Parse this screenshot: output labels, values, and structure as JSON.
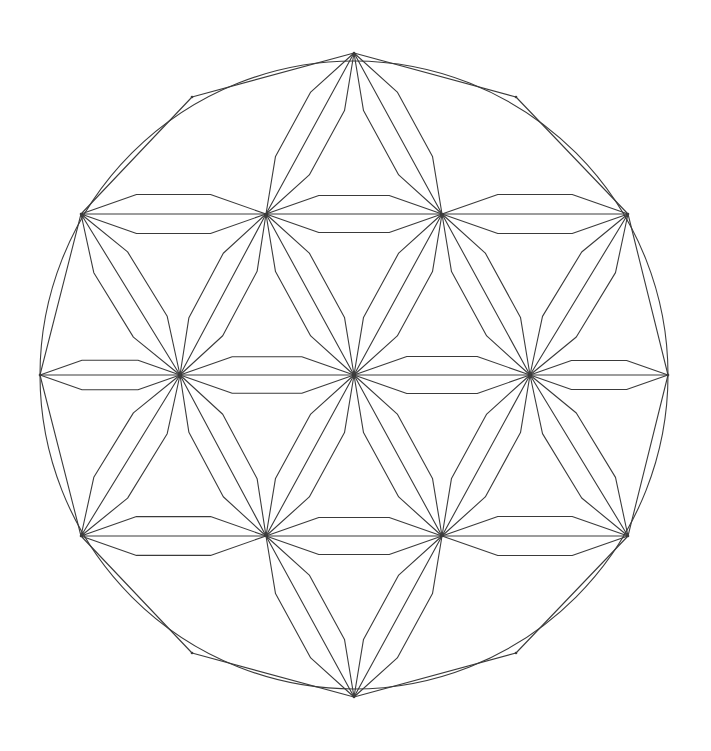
{
  "figure": {
    "title": "Triangular lattice mandala inside a circle",
    "type": "geometric-line-diagram",
    "background_color": "#ffffff",
    "stroke_color": "#3a3a3a",
    "stroke_width": 1.1,
    "canvas": {
      "width": 711,
      "height": 751
    }
  },
  "chart_data": {
    "type": "diagram",
    "title": "Triangular lattice mandala inside a circle",
    "circle": {
      "cx": 354,
      "cy": 375,
      "r": 314
    },
    "lattice": {
      "spacing_x": 176,
      "spacing_y": 161,
      "rows": [
        {
          "row": -2,
          "y": 53,
          "xs": [
            354
          ]
        },
        {
          "row": -1,
          "y": 214,
          "xs": [
            81,
            266,
            442,
            628
          ]
        },
        {
          "row": 0,
          "y": 375,
          "xs": [
            40,
            180,
            354,
            530,
            668
          ]
        },
        {
          "row": 1,
          "y": 536,
          "xs": [
            81,
            266,
            442,
            628
          ]
        },
        {
          "row": 2,
          "y": 697,
          "xs": [
            354
          ]
        }
      ]
    },
    "nodes": [
      {
        "id": "n-top",
        "x": 354,
        "y": 53,
        "rays": 6,
        "on_boundary": true
      },
      {
        "id": "n-upper-far-left",
        "x": 81,
        "y": 214,
        "rays": 8,
        "on_boundary": true
      },
      {
        "id": "n-upper-left",
        "x": 266,
        "y": 214,
        "rays": 12,
        "on_boundary": false
      },
      {
        "id": "n-upper-right",
        "x": 442,
        "y": 214,
        "rays": 12,
        "on_boundary": false
      },
      {
        "id": "n-upper-far-right",
        "x": 628,
        "y": 214,
        "rays": 8,
        "on_boundary": true
      },
      {
        "id": "n-mid-far-left",
        "x": 40,
        "y": 375,
        "rays": 4,
        "on_boundary": true
      },
      {
        "id": "n-mid-left",
        "x": 180,
        "y": 375,
        "rays": 12,
        "on_boundary": false
      },
      {
        "id": "n-center",
        "x": 354,
        "y": 375,
        "rays": 12,
        "on_boundary": false
      },
      {
        "id": "n-mid-right",
        "x": 530,
        "y": 375,
        "rays": 12,
        "on_boundary": false
      },
      {
        "id": "n-mid-far-right",
        "x": 668,
        "y": 375,
        "rays": 4,
        "on_boundary": true
      },
      {
        "id": "n-lower-far-left",
        "x": 81,
        "y": 536,
        "rays": 8,
        "on_boundary": true
      },
      {
        "id": "n-lower-left",
        "x": 266,
        "y": 536,
        "rays": 12,
        "on_boundary": false
      },
      {
        "id": "n-lower-right",
        "x": 442,
        "y": 536,
        "rays": 12,
        "on_boundary": false
      },
      {
        "id": "n-lower-far-right",
        "x": 628,
        "y": 536,
        "rays": 8,
        "on_boundary": true
      },
      {
        "id": "n-bottom",
        "x": 354,
        "y": 697,
        "rays": 6,
        "on_boundary": true
      },
      {
        "id": "n-arc-upper-left",
        "x": 192,
        "y": 97,
        "rays": 5,
        "on_boundary": true
      },
      {
        "id": "n-arc-upper-right",
        "x": 516,
        "y": 97,
        "rays": 5,
        "on_boundary": true
      },
      {
        "id": "n-arc-lower-left",
        "x": 192,
        "y": 653,
        "rays": 5,
        "on_boundary": true
      },
      {
        "id": "n-arc-lower-right",
        "x": 516,
        "y": 653,
        "rays": 5,
        "on_boundary": true
      }
    ],
    "edges": [
      [
        "n-arc-upper-left",
        "n-top"
      ],
      [
        "n-top",
        "n-arc-upper-right"
      ],
      [
        "n-upper-far-left",
        "n-arc-upper-left"
      ],
      [
        "n-arc-upper-right",
        "n-upper-far-right"
      ],
      [
        "n-upper-far-left",
        "n-upper-left"
      ],
      [
        "n-upper-left",
        "n-upper-right"
      ],
      [
        "n-upper-right",
        "n-upper-far-right"
      ],
      [
        "n-mid-far-left",
        "n-mid-left"
      ],
      [
        "n-mid-left",
        "n-center"
      ],
      [
        "n-center",
        "n-mid-right"
      ],
      [
        "n-mid-right",
        "n-mid-far-right"
      ],
      [
        "n-lower-far-left",
        "n-lower-left"
      ],
      [
        "n-lower-left",
        "n-lower-right"
      ],
      [
        "n-lower-right",
        "n-lower-far-right"
      ],
      [
        "n-arc-lower-left",
        "n-bottom"
      ],
      [
        "n-bottom",
        "n-arc-lower-right"
      ],
      [
        "n-lower-far-left",
        "n-arc-lower-left"
      ],
      [
        "n-arc-lower-right",
        "n-lower-far-right"
      ],
      [
        "n-upper-left",
        "n-top"
      ],
      [
        "n-upper-right",
        "n-top"
      ],
      [
        "n-upper-far-left",
        "n-mid-far-left"
      ],
      [
        "n-upper-far-left",
        "n-mid-left"
      ],
      [
        "n-upper-left",
        "n-mid-left"
      ],
      [
        "n-upper-left",
        "n-center"
      ],
      [
        "n-upper-right",
        "n-center"
      ],
      [
        "n-upper-right",
        "n-mid-right"
      ],
      [
        "n-upper-far-right",
        "n-mid-right"
      ],
      [
        "n-upper-far-right",
        "n-mid-far-right"
      ],
      [
        "n-mid-far-left",
        "n-lower-far-left"
      ],
      [
        "n-mid-left",
        "n-lower-far-left"
      ],
      [
        "n-mid-left",
        "n-lower-left"
      ],
      [
        "n-center",
        "n-lower-left"
      ],
      [
        "n-center",
        "n-lower-right"
      ],
      [
        "n-mid-right",
        "n-lower-right"
      ],
      [
        "n-mid-right",
        "n-lower-far-right"
      ],
      [
        "n-mid-far-right",
        "n-lower-far-right"
      ],
      [
        "n-lower-left",
        "n-bottom"
      ],
      [
        "n-lower-right",
        "n-bottom"
      ]
    ],
    "lens_edges": [
      [
        "n-upper-far-left",
        "n-upper-left"
      ],
      [
        "n-upper-left",
        "n-upper-right"
      ],
      [
        "n-upper-right",
        "n-upper-far-right"
      ],
      [
        "n-mid-far-left",
        "n-mid-left"
      ],
      [
        "n-mid-left",
        "n-center"
      ],
      [
        "n-center",
        "n-mid-right"
      ],
      [
        "n-mid-right",
        "n-mid-far-right"
      ],
      [
        "n-lower-far-left",
        "n-lower-left"
      ],
      [
        "n-lower-left",
        "n-lower-right"
      ],
      [
        "n-lower-right",
        "n-lower-far-right"
      ],
      [
        "n-upper-left",
        "n-top"
      ],
      [
        "n-upper-right",
        "n-top"
      ],
      [
        "n-upper-far-left",
        "n-mid-left"
      ],
      [
        "n-upper-left",
        "n-mid-left"
      ],
      [
        "n-upper-left",
        "n-center"
      ],
      [
        "n-upper-right",
        "n-center"
      ],
      [
        "n-upper-right",
        "n-mid-right"
      ],
      [
        "n-upper-far-right",
        "n-mid-right"
      ],
      [
        "n-mid-left",
        "n-lower-far-left"
      ],
      [
        "n-mid-left",
        "n-lower-left"
      ],
      [
        "n-center",
        "n-lower-left"
      ],
      [
        "n-center",
        "n-lower-right"
      ],
      [
        "n-mid-right",
        "n-lower-right"
      ],
      [
        "n-mid-right",
        "n-lower-far-right"
      ],
      [
        "n-lower-left",
        "n-bottom"
      ],
      [
        "n-lower-right",
        "n-bottom"
      ]
    ],
    "lens_geometry": {
      "half_width_fraction": 0.105,
      "shoulder_fraction": 0.3,
      "note": "Each lens is a narrow rhombus; its long sides are bent at two shoulder points so the silhouette reads as a flattened hexagon."
    },
    "symmetry": {
      "order": 6,
      "kind": "dihedral",
      "notes": "Six-fold rotational symmetry with mirror axes through the vertical and the two lattice diagonals."
    },
    "counts": {
      "nodes": 19,
      "straight_edges": 38,
      "lens_shapes": 26,
      "rays_at_center": 12
    },
    "axis_labels": {
      "x": "",
      "y": ""
    },
    "legend": [],
    "grid": false
  }
}
